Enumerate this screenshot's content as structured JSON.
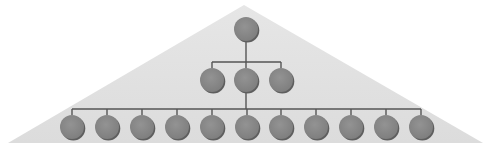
{
  "diagram": {
    "type": "org-hierarchy",
    "colors": {
      "background": "#ffffff",
      "triangle": "#e2e2e2",
      "node_fill": "#8a8a8a",
      "node_shadow": "#5e5e5e",
      "connector": "#555555"
    },
    "triangle": {
      "apex": [
        244,
        5
      ],
      "left": [
        8,
        143
      ],
      "right": [
        483,
        143
      ]
    },
    "levels": [
      {
        "level": 1,
        "count": 1,
        "y": 29,
        "xs": [
          246
        ],
        "bus_y": null
      },
      {
        "level": 2,
        "count": 3,
        "y": 80,
        "xs": [
          212,
          246,
          281
        ],
        "bus_y": 62
      },
      {
        "level": 3,
        "count": 11,
        "y": 127,
        "xs": [
          72,
          107,
          142,
          177,
          212,
          247,
          281,
          316,
          351,
          386,
          421
        ],
        "bus_y": 109
      }
    ],
    "node_radius": 12
  }
}
